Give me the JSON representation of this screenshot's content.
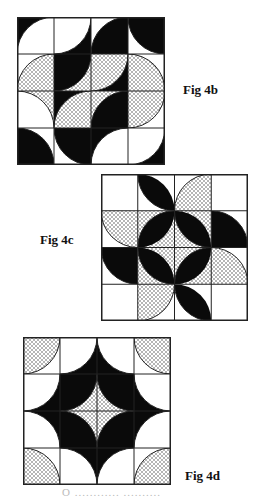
{
  "colors": {
    "black": "#0a0a0a",
    "white": "#ffffff",
    "line": "#222222",
    "dot": "#333333"
  },
  "figures": [
    {
      "id": "fig4b",
      "label": "Fig 4b",
      "box": {
        "x": 17,
        "y": 17,
        "size": 148
      },
      "label_pos": {
        "x": 183,
        "y": 82
      },
      "grid": 4,
      "cells": [
        [
          {
            "bg": "B",
            "disc": "W",
            "c": "br"
          },
          {
            "bg": "B",
            "disc": "W",
            "c": "tl"
          },
          {
            "bg": "W",
            "disc": "B",
            "c": "br"
          },
          {
            "bg": "W",
            "disc": "B",
            "c": "tr"
          }
        ],
        [
          {
            "bg": "W",
            "disc": "D",
            "c": "br"
          },
          {
            "bg": "D",
            "disc": "B",
            "c": "tl"
          },
          {
            "bg": "B",
            "disc": "D",
            "c": "tl"
          },
          {
            "bg": "W",
            "disc": "D",
            "c": "bl"
          }
        ],
        [
          {
            "bg": "D",
            "disc": "W",
            "c": "bl"
          },
          {
            "bg": "B",
            "disc": "D",
            "c": "br"
          },
          {
            "bg": "D",
            "disc": "B",
            "c": "br"
          },
          {
            "bg": "W",
            "disc": "D",
            "c": "tl"
          }
        ],
        [
          {
            "bg": "W",
            "disc": "B",
            "c": "bl"
          },
          {
            "bg": "W",
            "disc": "B",
            "c": "tr"
          },
          {
            "bg": "B",
            "disc": "W",
            "c": "br"
          },
          {
            "bg": "B",
            "disc": "W",
            "c": "tl"
          }
        ]
      ]
    },
    {
      "id": "fig4c",
      "label": "Fig 4c",
      "box": {
        "x": 101,
        "y": 174,
        "size": 147
      },
      "label_pos": {
        "x": 40,
        "y": 232
      },
      "grid": 4,
      "cells": [
        [
          {
            "bg": "W"
          },
          {
            "bg": "W",
            "leaf": "B",
            "c": [
              "bl",
              "tr"
            ]
          },
          {
            "bg": "W",
            "disc": "D",
            "c": "br"
          },
          {
            "bg": "W"
          }
        ],
        [
          {
            "bg": "W",
            "disc": "D",
            "c": "tr"
          },
          {
            "bg": "D",
            "leaf": "B",
            "c": [
              "tl",
              "br"
            ]
          },
          {
            "bg": "D",
            "leaf": "B",
            "c": [
              "bl",
              "tr"
            ]
          },
          {
            "bg": "W",
            "disc": "B",
            "c": "bl"
          }
        ],
        [
          {
            "bg": "W",
            "disc": "B",
            "c": "tr"
          },
          {
            "bg": "D",
            "leaf": "B",
            "c": [
              "bl",
              "tr"
            ]
          },
          {
            "bg": "D",
            "leaf": "B",
            "c": [
              "tl",
              "br"
            ]
          },
          {
            "bg": "W",
            "disc": "D",
            "c": "bl"
          }
        ],
        [
          {
            "bg": "W"
          },
          {
            "bg": "W",
            "disc": "D",
            "c": "tl"
          },
          {
            "bg": "W",
            "leaf": "B",
            "c": [
              "bl",
              "tr"
            ]
          },
          {
            "bg": "W"
          }
        ]
      ]
    },
    {
      "id": "fig4d",
      "label": "Fig 4d",
      "box": {
        "x": 23,
        "y": 337,
        "size": 148
      },
      "label_pos": {
        "x": 185,
        "y": 468
      },
      "grid": 4,
      "cells": [
        [
          {
            "bg": "W",
            "disc": "D",
            "c": "tl"
          },
          {
            "bg": "B",
            "disc": "W",
            "c": "tl"
          },
          {
            "bg": "B",
            "disc": "W",
            "c": "tr"
          },
          {
            "bg": "W",
            "disc": "D",
            "c": "tr"
          }
        ],
        [
          {
            "bg": "B",
            "disc": "W",
            "c": "tl"
          },
          {
            "bg": "D",
            "disc": "B",
            "c": "tl"
          },
          {
            "bg": "D",
            "disc": "B",
            "c": "tr"
          },
          {
            "bg": "B",
            "disc": "W",
            "c": "tr"
          }
        ],
        [
          {
            "bg": "B",
            "disc": "W",
            "c": "bl"
          },
          {
            "bg": "D",
            "disc": "B",
            "c": "bl"
          },
          {
            "bg": "D",
            "disc": "B",
            "c": "br"
          },
          {
            "bg": "B",
            "disc": "W",
            "c": "br"
          }
        ],
        [
          {
            "bg": "W",
            "disc": "D",
            "c": "bl"
          },
          {
            "bg": "B",
            "disc": "W",
            "c": "bl"
          },
          {
            "bg": "B",
            "disc": "W",
            "c": "br"
          },
          {
            "bg": "W",
            "disc": "D",
            "c": "br"
          }
        ]
      ]
    }
  ],
  "caption": {
    "text": "O ............ ..........",
    "x": 62,
    "y": 486
  }
}
